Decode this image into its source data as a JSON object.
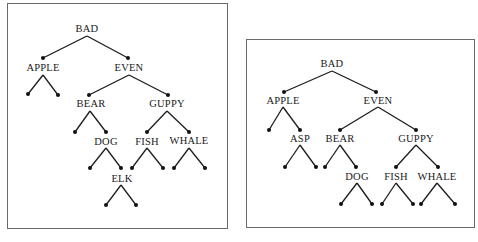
{
  "diagrams": [
    {
      "name": "left-tree",
      "frame": {
        "x": 7,
        "y": 3,
        "w": 221,
        "h": 226
      },
      "nodes": [
        {
          "id": "BAD",
          "label": "BAD",
          "lx": 87,
          "ly": 29,
          "dot": null
        },
        {
          "id": "APPLE",
          "label": "APPLE",
          "lx": 43,
          "ly": 68,
          "dot": [
            43,
            58
          ]
        },
        {
          "id": "EVEN",
          "label": "EVEN",
          "lx": 129,
          "ly": 68,
          "dot": [
            128,
            58
          ]
        },
        {
          "id": "BEAR",
          "label": "BEAR",
          "lx": 91,
          "ly": 104,
          "dot": [
            89,
            95
          ]
        },
        {
          "id": "GUPPY",
          "label": "GUPPY",
          "lx": 167,
          "ly": 104,
          "dot": [
            168,
            95
          ]
        },
        {
          "id": "DOG",
          "label": "DOG",
          "lx": 106,
          "ly": 142,
          "dot": [
            106,
            132
          ]
        },
        {
          "id": "FISH",
          "label": "FISH",
          "lx": 147,
          "ly": 142,
          "dot": [
            147,
            132
          ]
        },
        {
          "id": "WHALE",
          "label": "WHALE",
          "lx": 189,
          "ly": 141,
          "dot": [
            189,
            132
          ]
        },
        {
          "id": "ELK",
          "label": "ELK",
          "lx": 122,
          "ly": 179,
          "dot": [
            121,
            168
          ]
        }
      ],
      "edges": [
        [
          [
            87,
            36
          ],
          [
            43,
            58
          ]
        ],
        [
          [
            87,
            36
          ],
          [
            128,
            58
          ]
        ],
        [
          [
            43,
            75
          ],
          [
            28,
            94
          ]
        ],
        [
          [
            43,
            75
          ],
          [
            58,
            95
          ]
        ],
        [
          [
            129,
            75
          ],
          [
            89,
            95
          ]
        ],
        [
          [
            129,
            75
          ],
          [
            168,
            95
          ]
        ],
        [
          [
            90,
            111
          ],
          [
            75,
            132
          ]
        ],
        [
          [
            90,
            111
          ],
          [
            106,
            132
          ]
        ],
        [
          [
            167,
            111
          ],
          [
            147,
            132
          ]
        ],
        [
          [
            167,
            111
          ],
          [
            189,
            132
          ]
        ],
        [
          [
            106,
            148
          ],
          [
            90,
            168
          ]
        ],
        [
          [
            106,
            148
          ],
          [
            121,
            168
          ]
        ],
        [
          [
            147,
            148
          ],
          [
            132,
            168
          ]
        ],
        [
          [
            147,
            148
          ],
          [
            163,
            168
          ]
        ],
        [
          [
            189,
            148
          ],
          [
            174,
            168
          ]
        ],
        [
          [
            189,
            148
          ],
          [
            205,
            168
          ]
        ],
        [
          [
            121,
            185
          ],
          [
            106,
            205
          ]
        ],
        [
          [
            121,
            185
          ],
          [
            136,
            205
          ]
        ]
      ],
      "leaves": [
        [
          28,
          94
        ],
        [
          58,
          95
        ],
        [
          75,
          132
        ],
        [
          90,
          168
        ],
        [
          132,
          168
        ],
        [
          163,
          168
        ],
        [
          174,
          168
        ],
        [
          205,
          168
        ],
        [
          106,
          205
        ],
        [
          136,
          205
        ]
      ]
    },
    {
      "name": "right-tree",
      "frame": {
        "x": 246,
        "y": 39,
        "w": 229,
        "h": 189
      },
      "nodes": [
        {
          "id": "BAD",
          "label": "BAD",
          "lx": 332,
          "ly": 64,
          "dot": null
        },
        {
          "id": "APPLE",
          "label": "APPLE",
          "lx": 283,
          "ly": 101,
          "dot": [
            284,
            92
          ]
        },
        {
          "id": "EVEN",
          "label": "EVEN",
          "lx": 378,
          "ly": 101,
          "dot": [
            376,
            92
          ]
        },
        {
          "id": "ASP",
          "label": "ASP",
          "lx": 300,
          "ly": 139,
          "dot": [
            300,
            130
          ]
        },
        {
          "id": "BEAR",
          "label": "BEAR",
          "lx": 340,
          "ly": 139,
          "dot": [
            340,
            130
          ]
        },
        {
          "id": "GUPPY",
          "label": "GUPPY",
          "lx": 416,
          "ly": 139,
          "dot": [
            416,
            130
          ]
        },
        {
          "id": "DOG",
          "label": "DOG",
          "lx": 357,
          "ly": 177,
          "dot": [
            356,
            167
          ]
        },
        {
          "id": "FISH",
          "label": "FISH",
          "lx": 396,
          "ly": 177,
          "dot": [
            396,
            167
          ]
        },
        {
          "id": "WHALE",
          "label": "WHALE",
          "lx": 437,
          "ly": 177,
          "dot": [
            438,
            167
          ]
        }
      ],
      "edges": [
        [
          [
            332,
            71
          ],
          [
            284,
            92
          ]
        ],
        [
          [
            332,
            71
          ],
          [
            376,
            92
          ]
        ],
        [
          [
            283,
            107
          ],
          [
            269,
            130
          ]
        ],
        [
          [
            283,
            107
          ],
          [
            300,
            130
          ]
        ],
        [
          [
            378,
            107
          ],
          [
            340,
            130
          ]
        ],
        [
          [
            378,
            107
          ],
          [
            416,
            130
          ]
        ],
        [
          [
            300,
            145
          ],
          [
            285,
            167
          ]
        ],
        [
          [
            300,
            145
          ],
          [
            316,
            167
          ]
        ],
        [
          [
            340,
            145
          ],
          [
            325,
            167
          ]
        ],
        [
          [
            340,
            145
          ],
          [
            356,
            167
          ]
        ],
        [
          [
            416,
            145
          ],
          [
            396,
            167
          ]
        ],
        [
          [
            416,
            145
          ],
          [
            438,
            167
          ]
        ],
        [
          [
            357,
            183
          ],
          [
            341,
            204
          ]
        ],
        [
          [
            357,
            183
          ],
          [
            372,
            204
          ]
        ],
        [
          [
            396,
            183
          ],
          [
            382,
            204
          ]
        ],
        [
          [
            396,
            183
          ],
          [
            413,
            204
          ]
        ],
        [
          [
            437,
            183
          ],
          [
            421,
            204
          ]
        ],
        [
          [
            437,
            183
          ],
          [
            455,
            204
          ]
        ]
      ],
      "leaves": [
        [
          269,
          130
        ],
        [
          285,
          167
        ],
        [
          316,
          167
        ],
        [
          325,
          167
        ],
        [
          341,
          204
        ],
        [
          372,
          204
        ],
        [
          382,
          204
        ],
        [
          413,
          204
        ],
        [
          421,
          204
        ],
        [
          455,
          204
        ]
      ]
    }
  ],
  "colors": {
    "line": "#1c1c1c",
    "frame": "#6a6a6a",
    "text": "#1a1a1a"
  }
}
